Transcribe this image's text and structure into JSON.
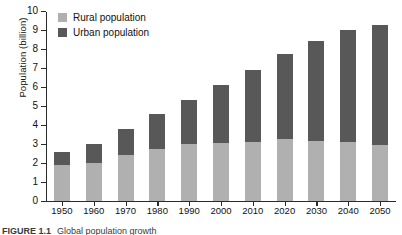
{
  "chart_data": {
    "type": "bar",
    "subtype": "stacked-vertical",
    "title": "",
    "xlabel": "",
    "ylabel": "Population (billion)",
    "ylim": [
      0,
      10
    ],
    "ytick_labels": [
      "0",
      "1",
      "2",
      "3",
      "4",
      "5",
      "6",
      "7",
      "8",
      "9",
      "10"
    ],
    "ytick_values": [
      0,
      1,
      2,
      3,
      4,
      5,
      6,
      7,
      8,
      9,
      10
    ],
    "grid": false,
    "legend_position": "top-left",
    "categories": [
      "1950",
      "1960",
      "1970",
      "1980",
      "1990",
      "2000",
      "2010",
      "2020",
      "2030",
      "2040",
      "2050"
    ],
    "series": [
      {
        "name": "Rural population",
        "color": "#b0b0b0",
        "values": [
          1.9,
          2.0,
          2.4,
          2.75,
          3.0,
          3.05,
          3.1,
          3.25,
          3.15,
          3.1,
          2.95
        ]
      },
      {
        "name": "Urban population",
        "color": "#585858",
        "values": [
          0.7,
          1.0,
          1.4,
          1.85,
          2.3,
          3.05,
          3.8,
          4.5,
          5.25,
          5.9,
          6.3
        ]
      }
    ],
    "totals": [
      2.6,
      3.0,
      3.8,
      4.6,
      5.3,
      6.1,
      6.9,
      7.75,
      8.4,
      9.0,
      9.25
    ]
  },
  "legend": {
    "items": [
      {
        "label": "Rural population",
        "color": "#b0b0b0"
      },
      {
        "label": "Urban population",
        "color": "#585858"
      }
    ]
  },
  "axes": {
    "y_title": "Population (billion)"
  },
  "caption": {
    "label": "FIGURE 1.1",
    "text": "Global population growth"
  }
}
